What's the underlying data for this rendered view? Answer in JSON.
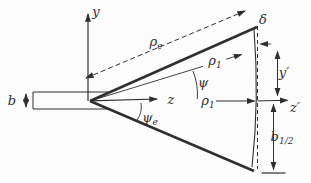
{
  "labels": {
    "y_axis": {
      "base": "y",
      "sub": ""
    },
    "z_axis": {
      "base": "z",
      "sub": ""
    },
    "b": {
      "base": "b",
      "sub": ""
    },
    "psi_e": {
      "base": "ψ",
      "sub": "e"
    },
    "psi": {
      "base": "ψ",
      "sub": ""
    },
    "rho_e": {
      "base": "ρ",
      "sub": "e"
    },
    "rho_1_slant": {
      "base": "ρ",
      "sub": "1"
    },
    "rho_1_axial": {
      "base": "ρ",
      "sub": "1"
    },
    "delta": {
      "base": "δ",
      "sub": ""
    },
    "y_prime": {
      "base": "y′",
      "sub": ""
    },
    "z_prime": {
      "base": "z′",
      "sub": ""
    },
    "b_half": {
      "base": "b",
      "sub": "1/2"
    }
  },
  "colors": {
    "line": "#2f2f2f",
    "ink": "#2f2f2f",
    "background": "#fcfcfc"
  }
}
